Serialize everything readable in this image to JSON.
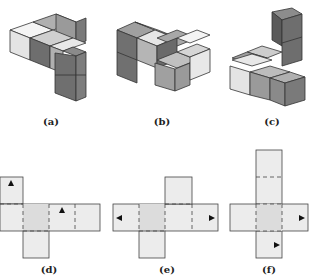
{
  "figures": [
    {
      "id": "a",
      "label": "(a)",
      "type": "cube-assembly"
    },
    {
      "id": "b",
      "label": "(b)",
      "type": "cube-assembly"
    },
    {
      "id": "c",
      "label": "(c)",
      "type": "cube-assembly"
    },
    {
      "id": "d",
      "label": "(d)",
      "type": "cube-net"
    },
    {
      "id": "e",
      "label": "(e)",
      "type": "cube-net"
    },
    {
      "id": "f",
      "label": "(f)",
      "type": "cube-net"
    }
  ],
  "colors": {
    "light": "#ececec",
    "mid": "#b8b8b8",
    "dark": "#8a8a8a",
    "darker": "#6e6e6e",
    "net_fill": "#ececec",
    "net_center": "#dcdcdc",
    "edge": "#333333"
  }
}
